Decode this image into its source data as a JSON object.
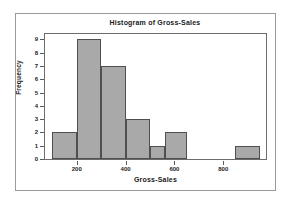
{
  "chart_data": {
    "type": "bar",
    "title": "Histogram of Gross-Sales",
    "xlabel": "Gross-Sales",
    "ylabel": "Frequency",
    "grid": false,
    "legend": "none",
    "bin_width": 100,
    "bin_starts": [
      100,
      200,
      300,
      400,
      500,
      600,
      700,
      800,
      850
    ],
    "categories": [
      "100-200",
      "200-300",
      "300-400",
      "400-500",
      "500-600",
      "600-650",
      "700-800",
      "800-850",
      "850-950"
    ],
    "values": [
      2,
      9,
      7,
      3,
      1,
      2,
      0,
      0,
      1
    ],
    "bars": [
      {
        "label": "100-200",
        "x0": 100,
        "x1": 200,
        "value": 2
      },
      {
        "label": "200-300",
        "x0": 200,
        "x1": 300,
        "value": 9
      },
      {
        "label": "300-400",
        "x0": 300,
        "x1": 400,
        "value": 7
      },
      {
        "label": "400-500",
        "x0": 400,
        "x1": 500,
        "value": 3
      },
      {
        "label": "500-560",
        "x0": 500,
        "x1": 560,
        "value": 1
      },
      {
        "label": "560-650",
        "x0": 560,
        "x1": 650,
        "value": 2
      },
      {
        "label": "650-750",
        "x0": 650,
        "x1": 750,
        "value": 0
      },
      {
        "label": "750-850",
        "x0": 750,
        "x1": 850,
        "value": 0
      },
      {
        "label": "850-950",
        "x0": 850,
        "x1": 950,
        "value": 1
      }
    ],
    "xlim": [
      70,
      975
    ],
    "ylim": [
      0,
      9.4
    ],
    "yticks": [
      0,
      1,
      2,
      3,
      4,
      5,
      6,
      7,
      8,
      9
    ],
    "ytick_labels": [
      "0",
      "1",
      "2",
      "3",
      "4",
      "5",
      "6",
      "7",
      "8",
      "9"
    ],
    "xticks": [
      200,
      400,
      600,
      800
    ],
    "xtick_labels": [
      "200",
      "400",
      "600",
      "800"
    ],
    "colors": {
      "bar_fill": "#a9a9a9",
      "bar_edge": "#4f4f4f",
      "axis": "#6d6d6d",
      "text": "#1a1a1a",
      "background": "#ffffff",
      "outer_frame": "#9a9a9a"
    }
  }
}
